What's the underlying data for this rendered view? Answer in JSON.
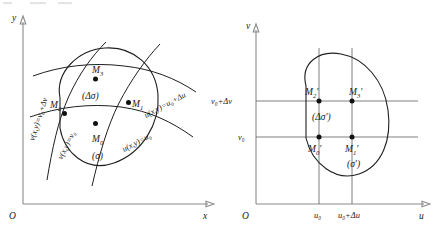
{
  "figure": {
    "type": "math-diagram"
  },
  "left_panel": {
    "name": "xy-plane",
    "axes": {
      "origin_label": "O",
      "x_label": "x",
      "y_label": "y"
    },
    "points": [
      {
        "id": "M0",
        "label": "M",
        "sub": "0"
      },
      {
        "id": "M1",
        "label": "M",
        "sub": "1"
      },
      {
        "id": "M2",
        "label": "M",
        "sub": "2"
      },
      {
        "id": "M3",
        "label": "M",
        "sub": "3"
      }
    ],
    "region_labels": {
      "inner": "(Δσ)",
      "outer": "(σ)"
    },
    "curve_labels": [
      {
        "id": "u-lower",
        "text": "u(x,y)=u₀"
      },
      {
        "id": "u-upper",
        "text": "u(x,y)=u₀+Δu"
      },
      {
        "id": "v-lower",
        "text": "v(x,y)=v₀"
      },
      {
        "id": "v-upper",
        "text": "v(x,y)=v₀+Δv"
      }
    ]
  },
  "right_panel": {
    "name": "uv-plane",
    "axes": {
      "origin_label": "O",
      "x_label": "u",
      "y_label": "v"
    },
    "points": [
      {
        "id": "M0p",
        "label": "M",
        "sub": "0",
        "prime": "′"
      },
      {
        "id": "M1p",
        "label": "M",
        "sub": "1",
        "prime": "′"
      },
      {
        "id": "M2p",
        "label": "M",
        "sub": "2",
        "prime": "′"
      },
      {
        "id": "M3p",
        "label": "M",
        "sub": "3",
        "prime": "′"
      }
    ],
    "region_labels": {
      "inner": "(Δσ′)",
      "outer": "(σ′)"
    },
    "x_ticks": [
      {
        "id": "u0",
        "text": "u₀"
      },
      {
        "id": "u0du",
        "text": "u₀+Δu"
      }
    ],
    "y_ticks": [
      {
        "id": "v0",
        "text": "v₀"
      },
      {
        "id": "v0dv",
        "text": "v₀+Δv"
      }
    ]
  },
  "colors": {
    "ink": "#1f1f1f",
    "axis": "#8a8a8a",
    "grid": "#6f6f6f",
    "background": "#ffffff"
  }
}
